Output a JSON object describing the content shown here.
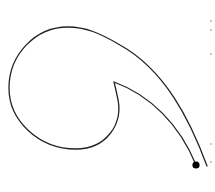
{
  "figure": {
    "stroke_color": "#222222",
    "dot_color": "#000000",
    "background": "#ffffff",
    "path": {
      "outer_end": [
        207,
        166
      ],
      "top_peak": [
        70,
        27
      ],
      "left_extreme": [
        9,
        88
      ],
      "bottom": [
        75,
        149
      ],
      "inner_cusp": [
        114,
        82
      ],
      "dot_end": [
        196,
        165
      ]
    },
    "dot": {
      "cx": 196,
      "cy": 165,
      "r": 3.6
    },
    "edge_marks_y": [
      20,
      29,
      53,
      143,
      161
    ]
  }
}
